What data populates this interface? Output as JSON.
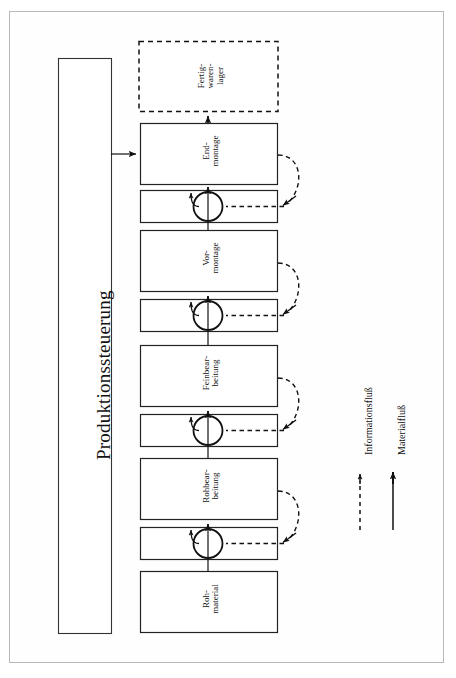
{
  "page": {
    "orientation": "rotated-90",
    "background": "#ffffff",
    "frame_color": "#b9b9b9",
    "line_color": "#111111"
  },
  "controller": {
    "label": "Produktionssteuerung"
  },
  "warehouse": {
    "label_lines": [
      "Fertig-",
      "waren-",
      "lager"
    ],
    "style": "dashed"
  },
  "stages": [
    {
      "id": "endmontage",
      "label_lines": [
        "End-",
        "montage"
      ],
      "has_buffer": true,
      "buffer_label": ""
    },
    {
      "id": "vormontage",
      "label_lines": [
        "Vor-",
        "montage"
      ],
      "has_buffer": true,
      "buffer_label": ""
    },
    {
      "id": "feinbearbeitung",
      "label_lines": [
        "Feinbear-",
        "beitung"
      ],
      "has_buffer": true,
      "buffer_label": ""
    },
    {
      "id": "rohbearbeitung",
      "label_lines": [
        "Rohbear-",
        "beitung"
      ],
      "has_buffer": true,
      "buffer_label": ""
    }
  ],
  "raw_material": {
    "label_lines": [
      "Roh-",
      "material"
    ]
  },
  "legend": [
    {
      "id": "informationsfluss",
      "label": "Informationsfluß",
      "line_style": "dashed"
    },
    {
      "id": "materialfluss",
      "label": "Materialfluß",
      "line_style": "solid"
    }
  ]
}
